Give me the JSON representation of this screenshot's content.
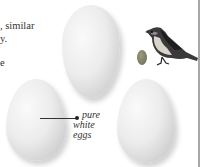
{
  "body_text": {
    "line1": ", similar",
    "line2": "y.",
    "line3": "e"
  },
  "annotation": {
    "line1": "pure",
    "line2": "white",
    "line3": "eggs"
  },
  "illustrations": {
    "eggs": [
      "large-white-egg-top",
      "large-white-egg-left",
      "large-white-egg-right"
    ],
    "small_egg_color": "#7a7a62",
    "bird": "small-passerine-bird"
  }
}
